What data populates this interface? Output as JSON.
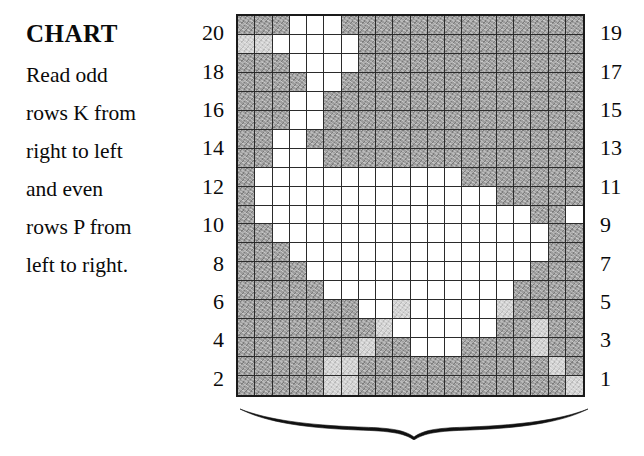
{
  "caption": {
    "title": "CHART",
    "lines": [
      "Read odd",
      "rows K from",
      "right to left",
      "and even",
      "rows P from",
      "left to right."
    ]
  },
  "row_numbers": {
    "left_label_note": "even row numbers, top to bottom",
    "left": [
      "20",
      "18",
      "16",
      "14",
      "12",
      "10",
      "8",
      "6",
      "4",
      "2"
    ],
    "right_label_note": "odd row numbers, top to bottom",
    "right": [
      "19",
      "17",
      "15",
      "13",
      "11",
      "9",
      "7",
      "5",
      "3",
      "1"
    ]
  },
  "colors": {
    "filled": "#9d9d9d",
    "light": "#d2d2d2",
    "empty": "#ffffff",
    "gridline": "#2b2b2b",
    "border": "#1a1a1a",
    "text": "#0a0a0a",
    "background": "#ffffff"
  },
  "ornament": {
    "name": "decorative-brace",
    "position": "below-chart"
  },
  "chart_data": {
    "type": "heatmap",
    "title": "CHART",
    "xlabel": "",
    "ylabel": "",
    "columns": 20,
    "rows": 20,
    "legend": [
      {
        "key": "f",
        "label": "filled (main colour)",
        "color": "#9d9d9d"
      },
      {
        "key": "l",
        "label": "light filled",
        "color": "#d2d2d2"
      },
      {
        "key": "w",
        "label": "empty (background colour)",
        "color": "#ffffff"
      }
    ],
    "row_order": "top row is chart row 20, bottom row is chart row 1",
    "row_labels_top_to_bottom": [
      20,
      19,
      18,
      17,
      16,
      15,
      14,
      13,
      12,
      11,
      10,
      9,
      8,
      7,
      6,
      5,
      4,
      3,
      2,
      1
    ],
    "grid": [
      [
        "f",
        "f",
        "f",
        "w",
        "w",
        "w",
        "f",
        "f",
        "f",
        "f",
        "f",
        "f",
        "f",
        "f",
        "f",
        "f",
        "f",
        "f",
        "f",
        "f"
      ],
      [
        "l",
        "l",
        "w",
        "w",
        "w",
        "w",
        "w",
        "f",
        "f",
        "f",
        "f",
        "f",
        "f",
        "f",
        "f",
        "f",
        "f",
        "f",
        "f",
        "f"
      ],
      [
        "f",
        "f",
        "f",
        "w",
        "w",
        "w",
        "w",
        "f",
        "f",
        "f",
        "f",
        "f",
        "f",
        "f",
        "f",
        "f",
        "f",
        "f",
        "f",
        "f"
      ],
      [
        "f",
        "f",
        "f",
        "f",
        "w",
        "w",
        "f",
        "f",
        "f",
        "f",
        "f",
        "f",
        "f",
        "f",
        "f",
        "f",
        "f",
        "f",
        "f",
        "f"
      ],
      [
        "f",
        "f",
        "f",
        "w",
        "w",
        "f",
        "f",
        "f",
        "f",
        "f",
        "f",
        "f",
        "f",
        "f",
        "f",
        "f",
        "f",
        "f",
        "f",
        "f"
      ],
      [
        "f",
        "f",
        "f",
        "w",
        "w",
        "f",
        "f",
        "f",
        "f",
        "f",
        "f",
        "f",
        "f",
        "f",
        "f",
        "f",
        "f",
        "f",
        "f",
        "f"
      ],
      [
        "f",
        "f",
        "w",
        "w",
        "f",
        "f",
        "f",
        "f",
        "f",
        "f",
        "f",
        "f",
        "f",
        "f",
        "f",
        "f",
        "f",
        "f",
        "f",
        "f"
      ],
      [
        "f",
        "f",
        "w",
        "w",
        "w",
        "f",
        "f",
        "f",
        "f",
        "f",
        "f",
        "f",
        "f",
        "f",
        "f",
        "f",
        "f",
        "f",
        "f",
        "f"
      ],
      [
        "f",
        "w",
        "w",
        "w",
        "w",
        "w",
        "w",
        "w",
        "w",
        "w",
        "w",
        "w",
        "w",
        "f",
        "f",
        "f",
        "f",
        "f",
        "f",
        "f"
      ],
      [
        "f",
        "w",
        "w",
        "w",
        "w",
        "w",
        "w",
        "w",
        "w",
        "w",
        "w",
        "w",
        "w",
        "w",
        "w",
        "f",
        "f",
        "f",
        "f",
        "f"
      ],
      [
        "f",
        "w",
        "w",
        "w",
        "w",
        "w",
        "w",
        "w",
        "w",
        "w",
        "w",
        "w",
        "w",
        "w",
        "w",
        "w",
        "w",
        "f",
        "f",
        "w"
      ],
      [
        "f",
        "f",
        "w",
        "w",
        "w",
        "w",
        "w",
        "w",
        "w",
        "w",
        "w",
        "w",
        "w",
        "w",
        "w",
        "w",
        "w",
        "w",
        "f",
        "f"
      ],
      [
        "f",
        "f",
        "f",
        "w",
        "w",
        "w",
        "w",
        "w",
        "w",
        "w",
        "w",
        "w",
        "w",
        "w",
        "w",
        "w",
        "w",
        "w",
        "f",
        "f"
      ],
      [
        "f",
        "f",
        "f",
        "f",
        "w",
        "w",
        "w",
        "w",
        "w",
        "w",
        "w",
        "w",
        "w",
        "w",
        "w",
        "w",
        "w",
        "f",
        "f",
        "f"
      ],
      [
        "f",
        "f",
        "f",
        "f",
        "f",
        "w",
        "w",
        "w",
        "w",
        "w",
        "w",
        "w",
        "w",
        "w",
        "w",
        "w",
        "f",
        "f",
        "f",
        "f"
      ],
      [
        "f",
        "f",
        "f",
        "f",
        "f",
        "f",
        "f",
        "w",
        "w",
        "l",
        "w",
        "w",
        "w",
        "w",
        "w",
        "l",
        "f",
        "f",
        "f",
        "f"
      ],
      [
        "f",
        "f",
        "f",
        "f",
        "f",
        "f",
        "f",
        "f",
        "l",
        "w",
        "w",
        "w",
        "w",
        "w",
        "w",
        "f",
        "f",
        "l",
        "f",
        "f"
      ],
      [
        "f",
        "f",
        "f",
        "f",
        "f",
        "f",
        "f",
        "l",
        "f",
        "f",
        "w",
        "w",
        "w",
        "f",
        "f",
        "f",
        "f",
        "l",
        "f",
        "f"
      ],
      [
        "f",
        "f",
        "f",
        "f",
        "f",
        "l",
        "l",
        "f",
        "f",
        "f",
        "f",
        "f",
        "f",
        "f",
        "f",
        "f",
        "f",
        "f",
        "l",
        "f"
      ],
      [
        "f",
        "f",
        "f",
        "f",
        "f",
        "l",
        "l",
        "f",
        "f",
        "f",
        "f",
        "f",
        "f",
        "f",
        "f",
        "f",
        "f",
        "f",
        "f",
        "l"
      ]
    ]
  }
}
